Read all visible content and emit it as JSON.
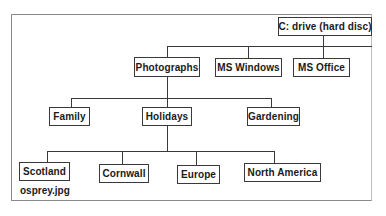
{
  "diagram": {
    "type": "folder-tree",
    "root": {
      "label": "C: drive (hard disc)"
    },
    "level1": [
      {
        "label": "Photographs"
      },
      {
        "label": "MS Windows"
      },
      {
        "label": "MS Office"
      }
    ],
    "level2": [
      {
        "label": "Family"
      },
      {
        "label": "Holidays"
      },
      {
        "label": "Gardening"
      }
    ],
    "level3": [
      {
        "label": "Scotland"
      },
      {
        "label": "Cornwall"
      },
      {
        "label": "Europe"
      },
      {
        "label": "North America"
      }
    ],
    "file": {
      "label": "osprey.jpg",
      "parent": "Scotland"
    },
    "edges": [
      [
        "C: drive (hard disc)",
        "Photographs"
      ],
      [
        "C: drive (hard disc)",
        "MS Windows"
      ],
      [
        "C: drive (hard disc)",
        "MS Office"
      ],
      [
        "Photographs",
        "Family"
      ],
      [
        "Photographs",
        "Holidays"
      ],
      [
        "Photographs",
        "Gardening"
      ],
      [
        "Holidays",
        "Scotland"
      ],
      [
        "Holidays",
        "Cornwall"
      ],
      [
        "Holidays",
        "Europe"
      ],
      [
        "Holidays",
        "North America"
      ]
    ],
    "colors": {
      "line": "#3a3a3a",
      "text": "#1a1a1a",
      "frame": "#8a8a8a",
      "background": "#ffffff"
    }
  }
}
